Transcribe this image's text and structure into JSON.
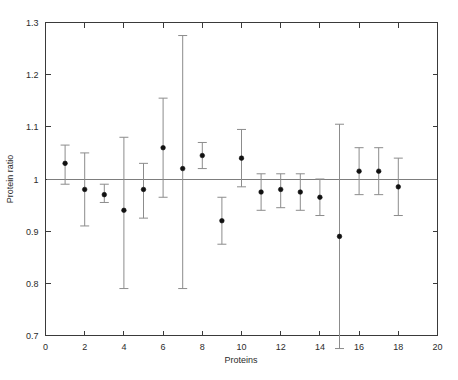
{
  "chart_data": {
    "type": "scatter",
    "title": "",
    "subtitle": "",
    "xlabel": "Proteins",
    "ylabel": "Protein ratio",
    "xlim": [
      0,
      20
    ],
    "ylim": [
      0.7,
      1.3
    ],
    "xticks": [
      0,
      2,
      4,
      6,
      8,
      10,
      12,
      14,
      16,
      18,
      20
    ],
    "xticklabels": [
      "0",
      "2",
      "4",
      "6",
      "8",
      "10",
      "12",
      "14",
      "16",
      "18",
      "20"
    ],
    "yticks": [
      0.7,
      0.8,
      0.9,
      1.0,
      1.1,
      1.2,
      1.3
    ],
    "yticklabels": [
      "0.7",
      "0.8",
      "0.9",
      "1",
      "1.1",
      "1.2",
      "1.3"
    ],
    "grid": false,
    "legend": null,
    "reference_line": {
      "orientation": "horizontal",
      "y": 1.0,
      "label": ""
    },
    "error_bars": true,
    "marker_style": "filled-circle",
    "marker_color": "#111111",
    "errorbar_color": "#8c8c8c",
    "x": [
      1,
      2,
      3,
      4,
      5,
      6,
      7,
      8,
      9,
      10,
      11,
      12,
      13,
      14,
      15,
      16,
      17,
      18
    ],
    "values": [
      1.03,
      0.98,
      0.97,
      0.94,
      0.98,
      1.06,
      1.02,
      1.045,
      0.92,
      1.04,
      0.975,
      0.98,
      0.975,
      0.965,
      0.89,
      1.015,
      1.015,
      0.985
    ],
    "error_low": [
      0.99,
      0.91,
      0.955,
      0.79,
      0.925,
      0.965,
      0.79,
      1.02,
      0.875,
      0.985,
      0.94,
      0.945,
      0.94,
      0.93,
      0.675,
      0.97,
      0.97,
      0.93
    ],
    "error_high": [
      1.065,
      1.05,
      0.99,
      1.08,
      1.03,
      1.155,
      1.275,
      1.07,
      0.965,
      1.095,
      1.01,
      1.01,
      1.01,
      1.0,
      1.105,
      1.06,
      1.06,
      1.04
    ]
  },
  "axes": {
    "xlabel": "Proteins",
    "ylabel": "Protein ratio"
  }
}
